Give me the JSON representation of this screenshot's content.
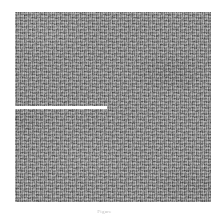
{
  "figure": {
    "panel": {
      "alt_name": "grayscale-speckle-micrograph",
      "background_color": "#8b8b8b",
      "width_px": 196,
      "height_px": 190
    },
    "scale_bar": {
      "color": "#ffffff",
      "orientation": "horizontal",
      "length_px": 92,
      "thickness_px": 3,
      "label": ""
    },
    "caption": {
      "label": "Figure",
      "text": "",
      "color": "#c9c9c9"
    }
  },
  "chart_data": {
    "type": "heatmap",
    "title": "",
    "xlabel": "",
    "ylabel": "",
    "grid": false,
    "legend": "none",
    "colormap": "grayscale",
    "value_range": [
      0,
      255
    ],
    "mean_level": 139,
    "annotations": [
      {
        "kind": "scale-bar",
        "color": "#ffffff",
        "x_start_frac": 0.0,
        "x_end_frac": 0.47,
        "y_frac": 0.5
      }
    ]
  }
}
